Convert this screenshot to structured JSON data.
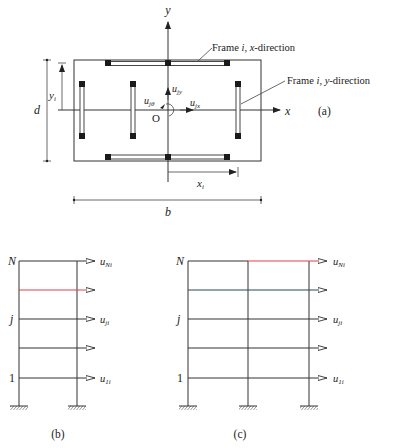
{
  "figure": {
    "panels": [
      {
        "id": "a",
        "label": "(a)",
        "title": "Plan view",
        "axes": {
          "x": "x",
          "y": "y",
          "origin": "O"
        },
        "dofs": {
          "ujx": "u",
          "ujx_sub": "jx",
          "ujy": "u",
          "ujy_sub": "jy",
          "ujtheta": "u",
          "ujtheta_sub": "jθ"
        },
        "dimensions": {
          "d": "d",
          "b": "b",
          "xi": "x",
          "xi_sub": "i",
          "yi": "y",
          "yi_sub": "i"
        },
        "callouts": {
          "frame_x": {
            "pre": "Frame ",
            "i": "i",
            "mid": ", ",
            "axis": "x",
            "post": "-direction"
          },
          "frame_y": {
            "pre": "Frame ",
            "i": "i",
            "mid": ", ",
            "axis": "y",
            "post": "-direction"
          }
        }
      },
      {
        "id": "b",
        "label": "(b)",
        "bays": 1,
        "levels": {
          "top": "N",
          "mid": "j",
          "bottom": "1"
        },
        "dofs": {
          "top": "u",
          "top_sub": "Ni",
          "mid": "u",
          "mid_sub": "ji",
          "bottom": "u",
          "bottom_sub": "1i"
        }
      },
      {
        "id": "c",
        "label": "(c)",
        "bays": 2,
        "levels": {
          "top": "N",
          "mid": "j",
          "bottom": "1"
        },
        "dofs": {
          "top": "u",
          "top_sub": "Ni",
          "mid": "u",
          "mid_sub": "ji",
          "bottom": "u",
          "bottom_sub": "1i"
        }
      }
    ],
    "colors": {
      "line": "#333333",
      "column": "#1a1a1a",
      "highlight": "#e0404a",
      "beam_c": "#2a4a4a"
    }
  }
}
